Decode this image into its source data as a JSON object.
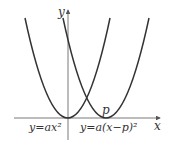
{
  "diagram": {
    "axes": {
      "x_label": "x",
      "y_label": "y"
    },
    "curves": [
      {
        "label": "y=ax²",
        "vertex": "origin"
      },
      {
        "label": "y=a(x−p)²",
        "vertex": "p"
      }
    ],
    "point_label": "p",
    "colors": {
      "curve": "#333333",
      "axis": "#555555"
    }
  }
}
